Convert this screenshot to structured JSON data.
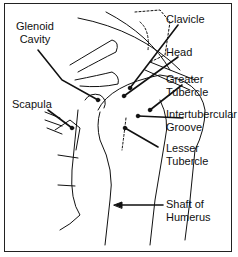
{
  "diagram": {
    "labels": [
      {
        "id": "glenoid",
        "text": "Glenoid\nCavity"
      },
      {
        "id": "clavicle",
        "text": "Clavicle"
      },
      {
        "id": "head",
        "text": "Head"
      },
      {
        "id": "greater",
        "text": "Greater\nTubercle"
      },
      {
        "id": "scapula",
        "text": "Scapula"
      },
      {
        "id": "intertub",
        "text": "Intertubercular\nGroove"
      },
      {
        "id": "lesser",
        "text": "Lesser\nTubercle"
      },
      {
        "id": "shaft",
        "text": "Shaft of\nHumerus"
      }
    ]
  }
}
